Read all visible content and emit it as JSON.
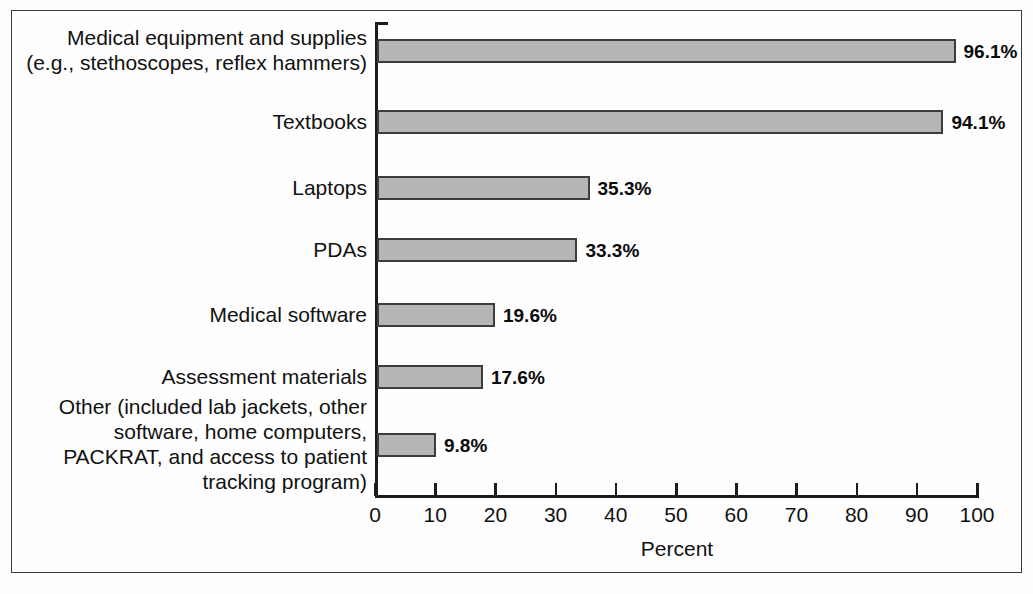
{
  "figure": {
    "background_color": "#fefefe",
    "frame_color": "#3a3a3a"
  },
  "axis": {
    "x_title": "Percent",
    "tick_labels": [
      "0",
      "10",
      "20",
      "30",
      "40",
      "50",
      "60",
      "70",
      "80",
      "90",
      "100"
    ]
  },
  "bars": [
    {
      "label": "Medical equipment and supplies\n(e.g., stethoscopes, reflex hammers)",
      "value_label": "96.1%",
      "value": 96.1
    },
    {
      "label": "Textbooks",
      "value_label": "94.1%",
      "value": 94.1
    },
    {
      "label": "Laptops",
      "value_label": "35.3%",
      "value": 35.3
    },
    {
      "label": "PDAs",
      "value_label": "33.3%",
      "value": 33.3
    },
    {
      "label": "Medical software",
      "value_label": "19.6%",
      "value": 19.6
    },
    {
      "label": "Assessment materials",
      "value_label": "17.6%",
      "value": 17.6
    },
    {
      "label": "Other (included lab jackets, other\nsoftware, home computers,\nPACKRAT, and access to patient\ntracking program)",
      "value_label": "9.8%",
      "value": 9.8
    }
  ],
  "chart_data": {
    "type": "bar",
    "orientation": "horizontal",
    "title": "",
    "subtitle": "",
    "xlabel": "Percent",
    "ylabel": "",
    "xlim": [
      0,
      100
    ],
    "xticks": [
      0,
      10,
      20,
      30,
      40,
      50,
      60,
      70,
      80,
      90,
      100
    ],
    "grid": false,
    "legend": false,
    "bar_fill_color": "#b6b6b6",
    "bar_edge_color": "#3d3d3d",
    "categories": [
      "Medical equipment and supplies (e.g., stethoscopes, reflex hammers)",
      "Textbooks",
      "Laptops",
      "PDAs",
      "Medical software",
      "Assessment materials",
      "Other (included lab jackets, other software, home computers, PACKRAT, and access to patient tracking program)"
    ],
    "values": [
      96.1,
      94.1,
      35.3,
      33.3,
      19.6,
      17.6,
      9.8
    ],
    "data_labels": [
      "96.1%",
      "94.1%",
      "35.3%",
      "33.3%",
      "19.6%",
      "17.6%",
      "9.8%"
    ]
  }
}
